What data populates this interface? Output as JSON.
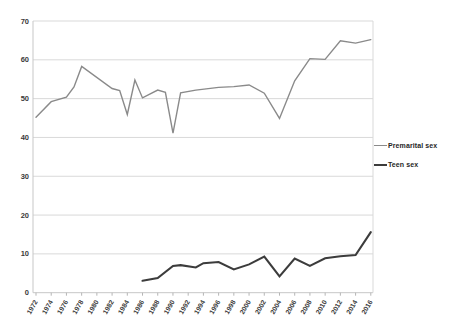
{
  "chart_data": {
    "type": "line",
    "title": "",
    "xlabel": "",
    "ylabel": "",
    "xlim": [
      1972,
      2016
    ],
    "ylim": [
      0,
      70
    ],
    "y_ticks": [
      0,
      10,
      20,
      30,
      40,
      50,
      60,
      70
    ],
    "x_tick_labels": [
      "1972",
      "1974",
      "1976",
      "1978",
      "1980",
      "1982",
      "1984",
      "1986",
      "1988",
      "1990",
      "1992",
      "1994",
      "1996",
      "1998",
      "2000",
      "2002",
      "2004",
      "2006",
      "2008",
      "2010",
      "2012",
      "2014",
      "2016"
    ],
    "grid": "horizontal",
    "legend_position": "right",
    "series": [
      {
        "name": "Premarital sex",
        "color": "#8a8a8a",
        "line_width": 1.4,
        "points": [
          [
            1972,
            45.2
          ],
          [
            1974,
            49.2
          ],
          [
            1976,
            50.4
          ],
          [
            1977,
            53.0
          ],
          [
            1978,
            58.3
          ],
          [
            1982,
            52.6
          ],
          [
            1983,
            52.1
          ],
          [
            1984,
            45.9
          ],
          [
            1985,
            54.8
          ],
          [
            1986,
            50.2
          ],
          [
            1988,
            52.2
          ],
          [
            1989,
            51.6
          ],
          [
            1990,
            41.1
          ],
          [
            1991,
            51.5
          ],
          [
            1993,
            52.2
          ],
          [
            1996,
            52.9
          ],
          [
            1998,
            53.1
          ],
          [
            2000,
            53.5
          ],
          [
            2002,
            51.4
          ],
          [
            2004,
            44.9
          ],
          [
            2006,
            54.6
          ],
          [
            2008,
            60.3
          ],
          [
            2010,
            60.1
          ],
          [
            2012,
            64.9
          ],
          [
            2014,
            64.3
          ],
          [
            2016,
            65.2
          ]
        ]
      },
      {
        "name": "Teen sex",
        "color": "#3c3c3c",
        "line_width": 2.1,
        "points": [
          [
            1986,
            3.1
          ],
          [
            1988,
            3.8
          ],
          [
            1990,
            6.9
          ],
          [
            1991,
            7.1
          ],
          [
            1993,
            6.5
          ],
          [
            1994,
            7.6
          ],
          [
            1996,
            7.9
          ],
          [
            1998,
            6.0
          ],
          [
            2000,
            7.3
          ],
          [
            2002,
            9.3
          ],
          [
            2004,
            4.2
          ],
          [
            2006,
            8.8
          ],
          [
            2008,
            6.9
          ],
          [
            2010,
            8.9
          ],
          [
            2012,
            9.4
          ],
          [
            2014,
            9.7
          ],
          [
            2016,
            15.6
          ]
        ]
      }
    ],
    "style": {
      "gridline_color": "#d9d9d9",
      "axis_color": "#c7c7c7",
      "tick_color": "#b5b5b5",
      "tick_label_color": "#3a3a3a",
      "background_color": "#ffffff"
    }
  }
}
